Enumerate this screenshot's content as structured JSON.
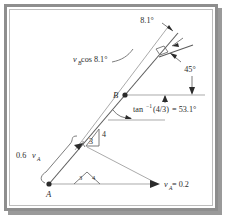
{
  "figure": {
    "kind": "kinematics-vector-diagram",
    "title": "",
    "colors": {
      "frame": "#8e8e8e",
      "frame_inner": "#bdbdbd",
      "line": "#5d5d5d",
      "light_line": "#9b9b9b",
      "text": "#2b2b2b",
      "background": "#ffffff"
    }
  },
  "points": {
    "A": {
      "label": "A",
      "x": 49,
      "y": 184
    },
    "B": {
      "label": "B",
      "x": 125,
      "y": 95
    }
  },
  "labels": {
    "angle_top": "8.1°",
    "angle_45": "45°",
    "vb_cos": {
      "base": "v",
      "sub": "B",
      "rest": " cos 8.1°"
    },
    "tan_inv": {
      "prefix": "tan",
      "sup": "−1",
      "arg": "(4/3)",
      "eq": " = 53.1°"
    },
    "rise": "4",
    "run": "3",
    "small_tri_left": "3",
    "small_tri_right": "4",
    "va_brace": {
      "coef": "0.6",
      "base": "v",
      "sub": "A"
    },
    "va_value": {
      "base": "v",
      "sub": "A",
      "eq": " = 0.2"
    }
  },
  "annotations": [
    {
      "name": "top-angle-8-1",
      "text": "8.1°"
    },
    {
      "name": "right-angle-45",
      "text": "45°"
    },
    {
      "name": "vb-cos-8-1",
      "text": "vB cos 8.1°"
    },
    {
      "name": "slope-angle",
      "text": "tan−1(4/3) = 53.1°"
    },
    {
      "name": "slope-rise",
      "text": "4"
    },
    {
      "name": "slope-run",
      "text": "3"
    },
    {
      "name": "velocity-a-scaled",
      "text": "0.6vA"
    },
    {
      "name": "velocity-a-value",
      "text": "vA = 0.2"
    },
    {
      "name": "point-a",
      "text": "A"
    },
    {
      "name": "point-b",
      "text": "B"
    }
  ]
}
